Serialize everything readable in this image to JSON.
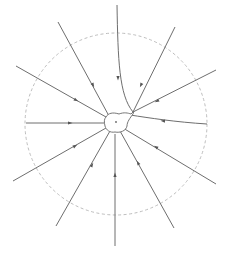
{
  "diagram": {
    "type": "field-lines",
    "colors": {
      "line": "#6e6e6e",
      "circle": "#b5b5b5",
      "arrow": "#555555"
    },
    "reference_circle": {
      "cx": 116,
      "cy": 124,
      "r": 91,
      "style": "dashed"
    },
    "central_body": {
      "cx": 115,
      "cy": 122
    },
    "field_lines": [
      {
        "id": "top-curve",
        "d": "M117,5 C118,60 119,95 133,112"
      },
      {
        "id": "nne",
        "d": "M175,27 L133,112"
      },
      {
        "id": "ne",
        "d": "M216,70 L133,112"
      },
      {
        "id": "e-curve",
        "d": "M207,124 C175,122 150,118 130,115"
      },
      {
        "id": "ese",
        "d": "M216,184 L123,128"
      },
      {
        "id": "sse",
        "d": "M174,228 L120,131"
      },
      {
        "id": "s",
        "d": "M115,246 L115,134"
      },
      {
        "id": "ssw",
        "d": "M56,226 L110,131"
      },
      {
        "id": "wsw",
        "d": "M13,181 L106,128"
      },
      {
        "id": "w",
        "d": "M26,123 L104,123"
      },
      {
        "id": "wnw",
        "d": "M16,66 L106,117"
      },
      {
        "id": "nnw",
        "d": "M58,22 L109,116"
      }
    ],
    "arrows": [
      {
        "x": 118,
        "y": 78,
        "angle": 90
      },
      {
        "x": 141,
        "y": 85,
        "angle": 116
      },
      {
        "x": 157,
        "y": 101,
        "angle": 153
      },
      {
        "x": 163,
        "y": 121,
        "angle": 183
      },
      {
        "x": 156,
        "y": 147,
        "angle": 211
      },
      {
        "x": 138,
        "y": 163,
        "angle": 241
      },
      {
        "x": 115,
        "y": 175,
        "angle": 270
      },
      {
        "x": 92,
        "y": 165,
        "angle": 300
      },
      {
        "x": 75,
        "y": 146,
        "angle": 330
      },
      {
        "x": 70,
        "y": 123,
        "angle": 0
      },
      {
        "x": 76,
        "y": 100,
        "angle": 29
      },
      {
        "x": 93,
        "y": 85,
        "angle": 62
      }
    ]
  }
}
